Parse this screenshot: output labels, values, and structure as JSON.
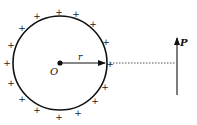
{
  "diagram": {
    "circle": {
      "cx": 60,
      "cy": 63,
      "r": 47,
      "stroke": "#111111"
    },
    "center": {
      "label": "O",
      "x": 60,
      "y": 63
    },
    "radius": {
      "label": "r"
    },
    "point_p": {
      "label": "P",
      "x": 177,
      "y_top": 37,
      "y_bottom": 95
    },
    "dotted_line": {
      "x1": 110,
      "x2": 176,
      "y": 63
    },
    "charge_symbol": "+",
    "charges": [
      {
        "x": 59,
        "y": 12
      },
      {
        "x": 76,
        "y": 14
      },
      {
        "x": 37,
        "y": 16
      },
      {
        "x": 93,
        "y": 24
      },
      {
        "x": 22,
        "y": 28
      },
      {
        "x": 106,
        "y": 42
      },
      {
        "x": 11,
        "y": 45
      },
      {
        "x": 7,
        "y": 63
      },
      {
        "x": 110,
        "y": 64
      },
      {
        "x": 11,
        "y": 83
      },
      {
        "x": 105,
        "y": 87
      },
      {
        "x": 22,
        "y": 99
      },
      {
        "x": 95,
        "y": 101
      },
      {
        "x": 37,
        "y": 110
      },
      {
        "x": 78,
        "y": 113
      },
      {
        "x": 59,
        "y": 117
      }
    ]
  }
}
